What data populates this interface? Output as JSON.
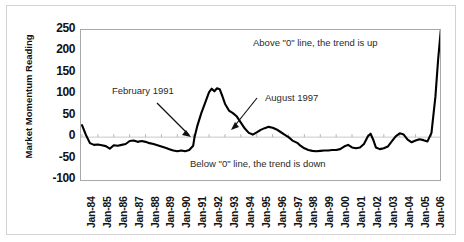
{
  "chart_data": {
    "type": "line",
    "title": "",
    "xlabel": "",
    "ylabel": "Market Momentum Reading",
    "ylim": [
      -100,
      250
    ],
    "yticks": [
      250,
      200,
      150,
      100,
      50,
      0,
      -50,
      -100
    ],
    "grid": false,
    "legend": null,
    "zero_line": 0,
    "categories": [
      "Jan-84",
      "Jan-85",
      "Jan-86",
      "Jan-87",
      "Jan-88",
      "Jan-89",
      "Jan-90",
      "Jan-91",
      "Jan-92",
      "Jan-93",
      "Jan-94",
      "Jan-95",
      "Jan-96",
      "Jan-97",
      "Jan-98",
      "Jan-99",
      "Jan-00",
      "Jan-01",
      "Jan-02",
      "Jan-03",
      "Jan-04",
      "Jan-05",
      "Jan-06"
    ],
    "series": [
      {
        "name": "Market Momentum Reading",
        "points": [
          {
            "x": "Jan-84",
            "y": 28
          },
          {
            "x": "Apr-84",
            "y": 5
          },
          {
            "x": "Jul-84",
            "y": -14
          },
          {
            "x": "Oct-84",
            "y": -18
          },
          {
            "x": "Jan-85",
            "y": -17
          },
          {
            "x": "Apr-85",
            "y": -19
          },
          {
            "x": "Jul-85",
            "y": -21
          },
          {
            "x": "Oct-85",
            "y": -27
          },
          {
            "x": "Jan-86",
            "y": -19
          },
          {
            "x": "Apr-86",
            "y": -20
          },
          {
            "x": "Jul-86",
            "y": -18
          },
          {
            "x": "Oct-86",
            "y": -16
          },
          {
            "x": "Jan-87",
            "y": -9
          },
          {
            "x": "Apr-87",
            "y": -8
          },
          {
            "x": "Jul-87",
            "y": -11
          },
          {
            "x": "Oct-87",
            "y": -9
          },
          {
            "x": "Jan-88",
            "y": -11
          },
          {
            "x": "Apr-88",
            "y": -14
          },
          {
            "x": "Jul-88",
            "y": -16
          },
          {
            "x": "Oct-88",
            "y": -19
          },
          {
            "x": "Jan-89",
            "y": -22
          },
          {
            "x": "Apr-89",
            "y": -25
          },
          {
            "x": "Jul-89",
            "y": -28
          },
          {
            "x": "Oct-89",
            "y": -31
          },
          {
            "x": "Jan-90",
            "y": -33
          },
          {
            "x": "Apr-90",
            "y": -31
          },
          {
            "x": "Jul-90",
            "y": -33
          },
          {
            "x": "Oct-90",
            "y": -30
          },
          {
            "x": "Jan-91",
            "y": -20
          },
          {
            "x": "Feb-91",
            "y": 0
          },
          {
            "x": "Apr-91",
            "y": 25
          },
          {
            "x": "Jul-91",
            "y": 55
          },
          {
            "x": "Oct-91",
            "y": 80
          },
          {
            "x": "Jan-92",
            "y": 105
          },
          {
            "x": "Mar-92",
            "y": 113
          },
          {
            "x": "May-92",
            "y": 107
          },
          {
            "x": "Jul-92",
            "y": 114
          },
          {
            "x": "Sep-92",
            "y": 112
          },
          {
            "x": "Nov-92",
            "y": 96
          },
          {
            "x": "Jan-93",
            "y": 78
          },
          {
            "x": "Apr-93",
            "y": 62
          },
          {
            "x": "Jul-93",
            "y": 56
          },
          {
            "x": "Oct-93",
            "y": 48
          },
          {
            "x": "Jan-94",
            "y": 34
          },
          {
            "x": "Apr-94",
            "y": 20
          },
          {
            "x": "Jul-94",
            "y": 10
          },
          {
            "x": "Oct-94",
            "y": 6
          },
          {
            "x": "Jan-95",
            "y": 11
          },
          {
            "x": "Apr-95",
            "y": 17
          },
          {
            "x": "Jul-95",
            "y": 21
          },
          {
            "x": "Oct-95",
            "y": 24
          },
          {
            "x": "Jan-96",
            "y": 22
          },
          {
            "x": "Apr-96",
            "y": 18
          },
          {
            "x": "Jul-96",
            "y": 12
          },
          {
            "x": "Oct-96",
            "y": 6
          },
          {
            "x": "Jan-97",
            "y": 0
          },
          {
            "x": "Apr-97",
            "y": -8
          },
          {
            "x": "Aug-97",
            "y": -14
          },
          {
            "x": "Oct-97",
            "y": -20
          },
          {
            "x": "Jan-98",
            "y": -26
          },
          {
            "x": "Apr-98",
            "y": -30
          },
          {
            "x": "Jul-98",
            "y": -32
          },
          {
            "x": "Oct-98",
            "y": -33
          },
          {
            "x": "Jan-99",
            "y": -32
          },
          {
            "x": "Apr-99",
            "y": -31
          },
          {
            "x": "Jul-99",
            "y": -31
          },
          {
            "x": "Oct-99",
            "y": -30
          },
          {
            "x": "Jan-00",
            "y": -30
          },
          {
            "x": "Apr-00",
            "y": -28
          },
          {
            "x": "Jul-00",
            "y": -22
          },
          {
            "x": "Oct-00",
            "y": -18
          },
          {
            "x": "Jan-01",
            "y": -24
          },
          {
            "x": "Apr-01",
            "y": -26
          },
          {
            "x": "Jul-01",
            "y": -24
          },
          {
            "x": "Oct-01",
            "y": -16
          },
          {
            "x": "Jan-02",
            "y": 2
          },
          {
            "x": "Mar-02",
            "y": 8
          },
          {
            "x": "May-02",
            "y": -6
          },
          {
            "x": "Jul-02",
            "y": -24
          },
          {
            "x": "Oct-02",
            "y": -28
          },
          {
            "x": "Jan-03",
            "y": -26
          },
          {
            "x": "Apr-03",
            "y": -22
          },
          {
            "x": "Jul-03",
            "y": -10
          },
          {
            "x": "Oct-03",
            "y": 2
          },
          {
            "x": "Jan-04",
            "y": 9
          },
          {
            "x": "Apr-04",
            "y": 6
          },
          {
            "x": "Jul-04",
            "y": -6
          },
          {
            "x": "Oct-04",
            "y": -12
          },
          {
            "x": "Jan-05",
            "y": -8
          },
          {
            "x": "Apr-05",
            "y": -5
          },
          {
            "x": "Jul-05",
            "y": -7
          },
          {
            "x": "Oct-05",
            "y": -10
          },
          {
            "x": "Jan-06",
            "y": 10
          },
          {
            "x": "Apr-06",
            "y": 95
          },
          {
            "x": "Jun-06",
            "y": 180
          },
          {
            "x": "Aug-06",
            "y": 248
          }
        ]
      }
    ],
    "annotations": [
      {
        "id": "feb-1991",
        "text": "February 1991"
      },
      {
        "id": "aug-1997",
        "text": "August 1997"
      },
      {
        "id": "above-zero",
        "text": "Above \"0\" line, the trend is up"
      },
      {
        "id": "below-zero",
        "text": "Below \"0\" line, the trend is down"
      }
    ],
    "colors": {
      "line": "#000000",
      "plot_border": "#a8a8a8",
      "frame_border": "#d2d2d2",
      "background": "#ffffff",
      "text": "#111111"
    }
  }
}
